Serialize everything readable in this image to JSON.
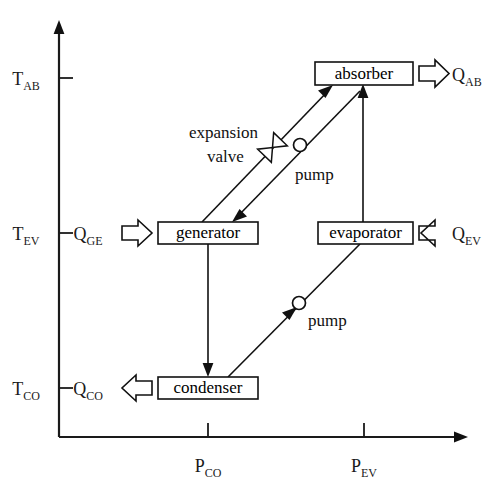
{
  "diagram": {
    "background_color": "#ffffff",
    "line_color": "#111111",
    "axes": {
      "y_axis": {
        "name": "temperature-axis",
        "ticks": [
          {
            "id": "t-ab",
            "base": "T",
            "sub": "AB",
            "y": 78
          },
          {
            "id": "t-ev",
            "base": "T",
            "sub": "EV",
            "y": 233
          },
          {
            "id": "t-co",
            "base": "T",
            "sub": "CO",
            "y": 388
          }
        ]
      },
      "x_axis": {
        "name": "pressure-axis",
        "ticks": [
          {
            "id": "p-co",
            "base": "P",
            "sub": "CO",
            "x": 208
          },
          {
            "id": "p-ev",
            "base": "P",
            "sub": "EV",
            "x": 364
          }
        ]
      }
    },
    "components": [
      {
        "id": "absorber",
        "label": "absorber",
        "x": 315,
        "y": 62,
        "w": 98,
        "h": 23
      },
      {
        "id": "generator",
        "label": "generator",
        "x": 158,
        "y": 222,
        "w": 100,
        "h": 22
      },
      {
        "id": "evaporator",
        "label": "evaporator",
        "x": 318,
        "y": 222,
        "w": 95,
        "h": 22
      },
      {
        "id": "condenser",
        "label": "condenser",
        "x": 158,
        "y": 377,
        "w": 100,
        "h": 22
      }
    ],
    "heat_flows": [
      {
        "id": "q-ab",
        "base": "Q",
        "sub": "AB",
        "direction": "right",
        "attached_to": "absorber"
      },
      {
        "id": "q-ge",
        "base": "Q",
        "sub": "GE",
        "direction": "right",
        "attached_to": "generator"
      },
      {
        "id": "q-ev",
        "base": "Q",
        "sub": "EV",
        "direction": "left",
        "attached_to": "evaporator"
      },
      {
        "id": "q-co",
        "base": "Q",
        "sub": "CO",
        "direction": "left",
        "attached_to": "condenser"
      }
    ],
    "annotations": [
      {
        "id": "expansion-valve",
        "line1": "expansion",
        "line2": "valve"
      },
      {
        "id": "pump-upper",
        "label": "pump"
      },
      {
        "id": "pump-lower",
        "label": "pump"
      }
    ],
    "connections": [
      {
        "id": "generator-to-absorber",
        "from": "generator",
        "to": "absorber",
        "symbol": "expansion-valve"
      },
      {
        "id": "absorber-to-generator",
        "from": "absorber",
        "to": "generator",
        "symbol": "pump-upper"
      },
      {
        "id": "evaporator-to-absorber",
        "from": "evaporator",
        "to": "absorber",
        "symbol": "none"
      },
      {
        "id": "generator-to-condenser",
        "from": "generator",
        "to": "condenser",
        "symbol": "none"
      },
      {
        "id": "condenser-to-evaporator",
        "from": "condenser",
        "to": "evaporator",
        "symbol": "pump-lower"
      }
    ]
  }
}
